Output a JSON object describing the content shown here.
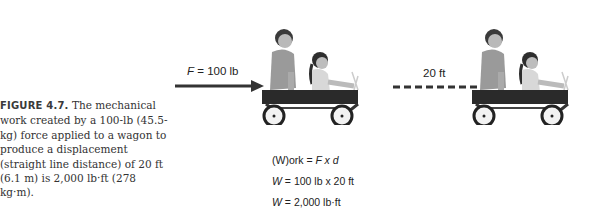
{
  "caption": {
    "lead": "FIGURE 4.7.",
    "text": " The mechanical work created by a 100-lb (45.5-kg) force applied to a wagon to produce a displacement (straight line distance) of 20 ft (6.1 m) is 2,000 lb·ft (278 kg·m)."
  },
  "diagram": {
    "force_symbol": "F",
    "force_value": " = 100 lb",
    "distance_label": "20 ft",
    "equations": [
      {
        "lhs": "(W)ork",
        "rhs_sym": " = ",
        "rhs": "F x d"
      },
      {
        "lhs": "W",
        "rhs": " = 100 lb x 20 ft"
      },
      {
        "lhs": "W",
        "rhs": " = 2,000 lb·ft"
      }
    ]
  },
  "colors": {
    "arrow": "#333333",
    "dash": "#333333",
    "wagon_body": "#2a2a2a"
  }
}
